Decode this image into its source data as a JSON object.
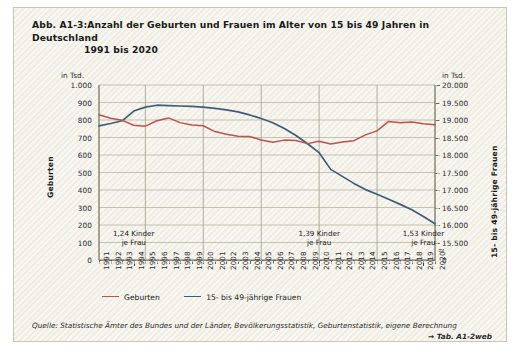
{
  "figure": {
    "number": "Abb. A1-3:",
    "title_line1": "Anzahl der Geburten und Frauen im Alter von 15 bis 49 Jahren in Deutschland",
    "title_line2": "1991 bis 2020"
  },
  "source": {
    "text": "Quelle: Statistische Ämter des Bundes und der Länder, Bevölkerungsstatistik, Geburtenstatistik, eigene Berechnung",
    "reference": "→ Tab. A1-2web"
  },
  "axes": {
    "left_unit": "in Tsd.",
    "right_unit": "in Tsd.",
    "left_title": "Geburten",
    "right_title": "15- bis 49-jährige Frauen",
    "left_ticks": [
      "1.000",
      "900",
      "800",
      "700",
      "600",
      "500",
      "400",
      "300",
      "200",
      "100",
      "0"
    ],
    "right_ticks": [
      "20.000",
      "19.500",
      "19.000",
      "18.500",
      "18.000",
      "17.500",
      "17.000",
      "16.500",
      "16.000",
      "15.500",
      "0"
    ],
    "axis_break_symbol": "≈"
  },
  "legend": {
    "position": "bottom-left",
    "items": [
      {
        "label": "Geburten",
        "color": "#c0504d"
      },
      {
        "label": "15- bis 49-jährige Frauen",
        "color": "#3f5c78"
      }
    ]
  },
  "annotations": [
    {
      "year": 1994,
      "line1": "1,24 Kinder",
      "line2": "je Frau"
    },
    {
      "year": 2010,
      "line1": "1,39 Kinder",
      "line2": "je Frau"
    },
    {
      "year": 2019,
      "line1": "1,53 Kinder",
      "line2": "je Frau"
    }
  ],
  "colors": {
    "births": "#c0504d",
    "women": "#3f5c78",
    "paper": "#f2f0e6",
    "grid": "#b9b5a3",
    "axis": "#6e6a5c"
  },
  "chart_data": {
    "type": "line",
    "title": "Anzahl der Geburten und Frauen im Alter von 15 bis 49 Jahren in Deutschland 1991 bis 2020",
    "xlabel": "",
    "ylabel": "Geburten",
    "y2label": "15- bis 49-jährige Frauen",
    "grid": true,
    "ylim": [
      0,
      1000
    ],
    "y2lim": [
      15500,
      20000
    ],
    "x": [
      1991,
      1992,
      1993,
      1994,
      1995,
      1996,
      1997,
      1998,
      1999,
      2000,
      2001,
      2002,
      2003,
      2004,
      2005,
      2006,
      2007,
      2008,
      2009,
      2010,
      2011,
      2012,
      2013,
      2014,
      2015,
      2016,
      2017,
      2018,
      2019,
      2020
    ],
    "series": [
      {
        "name": "Geburten",
        "unit": "Tsd.",
        "axis": "left",
        "color": "#c0504d",
        "values": [
          830,
          810,
          798,
          770,
          765,
          796,
          812,
          785,
          771,
          767,
          734,
          719,
          707,
          706,
          686,
          673,
          685,
          683,
          665,
          678,
          663,
          674,
          682,
          715,
          738,
          792,
          785,
          788,
          778,
          773
        ]
      },
      {
        "name": "15- bis 49-jährige Frauen",
        "unit": "Tsd.",
        "axis": "right",
        "color": "#3f5c78",
        "values": [
          18950,
          19010,
          19080,
          19330,
          19430,
          19480,
          19470,
          19460,
          19450,
          19430,
          19400,
          19360,
          19310,
          19230,
          19140,
          19030,
          18880,
          18700,
          18490,
          18260,
          17830,
          17650,
          17470,
          17310,
          17190,
          17060,
          16930,
          16790,
          16620,
          16430
        ]
      }
    ],
    "annotations": [
      {
        "x": 1994,
        "text": "1,24 Kinder je Frau"
      },
      {
        "x": 2010,
        "text": "1,39 Kinder je Frau"
      },
      {
        "x": 2019,
        "text": "1,53 Kinder je Frau"
      }
    ]
  }
}
